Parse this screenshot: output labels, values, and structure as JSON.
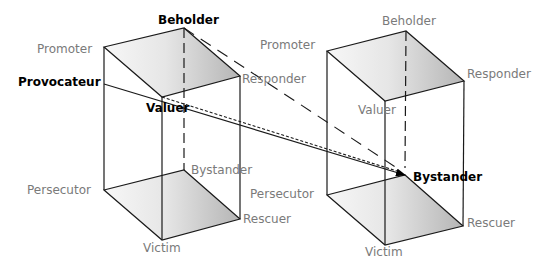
{
  "diagram": {
    "colors": {
      "edge": "#1a1a1a",
      "label_muted": "#7a7a7a",
      "label_emphasis": "#000000",
      "face_light": "#f4f4f4",
      "face_dark": "#b8b8b8"
    },
    "left_cube": {
      "top_face": {
        "promoter": "Promoter",
        "beholder": "Beholder",
        "responder": "Responder",
        "valuer": "Valuer"
      },
      "bottom_face": {
        "persecutor": "Persecutor",
        "bystander": "Bystander",
        "rescuer": "Rescuer",
        "victim": "Victim"
      },
      "extra": {
        "provocateur": "Provocateur"
      }
    },
    "right_cube": {
      "top_face": {
        "promoter": "Promoter",
        "beholder": "Beholder",
        "responder": "Responder",
        "valuer": "Valuer"
      },
      "bottom_face": {
        "persecutor": "Persecutor",
        "bystander": "Bystander",
        "rescuer": "Rescuer",
        "victim": "Victim"
      }
    },
    "connections": [
      {
        "from": "Provocateur",
        "to": "Bystander",
        "style": "solid-arrow"
      },
      {
        "from": "Valuer",
        "to": "Bystander",
        "style": "dotted"
      },
      {
        "from": "Beholder",
        "to": "Bystander",
        "style": "dashed"
      }
    ]
  }
}
